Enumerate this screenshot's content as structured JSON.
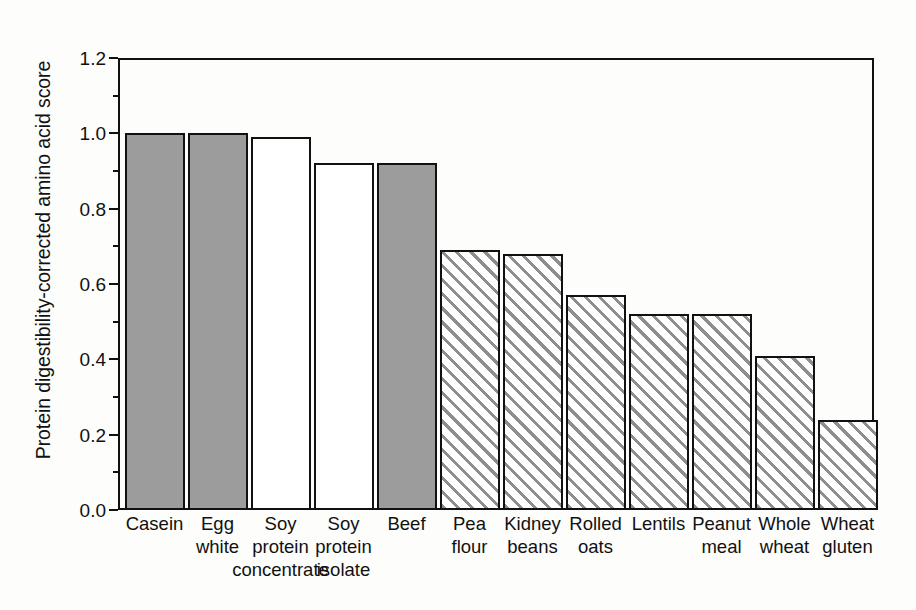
{
  "chart_data": {
    "type": "bar",
    "title": "",
    "subtitle": "",
    "xlabel": "",
    "ylabel": "Protein digestibility-corrected amino acid score",
    "ylim": [
      0.0,
      1.2
    ],
    "ytick_labels": [
      "0.0",
      "0.2",
      "0.4",
      "0.6",
      "0.8",
      "1.0",
      "1.2"
    ],
    "ytick_values": [
      0.0,
      0.2,
      0.4,
      0.6,
      0.8,
      1.0,
      1.2
    ],
    "minor_tick_interval": 0.1,
    "grid": false,
    "legend": null,
    "legend_position": "none",
    "categories": [
      "Casein",
      "Egg white",
      "Soy protein concentrate",
      "Soy protein isolate",
      "Beef",
      "Pea flour",
      "Kidney beans",
      "Rolled oats",
      "Lentils",
      "Peanut meal",
      "Whole wheat",
      "Wheat gluten"
    ],
    "category_lines": [
      [
        "Casein"
      ],
      [
        "Egg",
        "white"
      ],
      [
        "Soy",
        "protein",
        "concentrate"
      ],
      [
        "Soy",
        "protein",
        "isolate"
      ],
      [
        "Beef"
      ],
      [
        "Pea",
        "flour"
      ],
      [
        "Kidney",
        "beans"
      ],
      [
        "Rolled",
        "oats"
      ],
      [
        "Lentils"
      ],
      [
        "Peanut",
        "meal"
      ],
      [
        "Whole",
        "wheat"
      ],
      [
        "Wheat",
        "gluten"
      ]
    ],
    "values": [
      1.0,
      1.0,
      0.99,
      0.92,
      0.92,
      0.69,
      0.68,
      0.57,
      0.52,
      0.52,
      0.41,
      0.24
    ],
    "bar_fills": [
      "gray",
      "gray",
      "white",
      "white",
      "gray",
      "hatch",
      "hatch",
      "hatch",
      "hatch",
      "hatch",
      "hatch",
      "hatch"
    ],
    "colors": {
      "gray_fill": "#9c9c9c",
      "white_fill": "#ffffff",
      "hatch_line": "#8e8e8e",
      "outline": "#111111",
      "background": "#fdfdfc"
    }
  }
}
